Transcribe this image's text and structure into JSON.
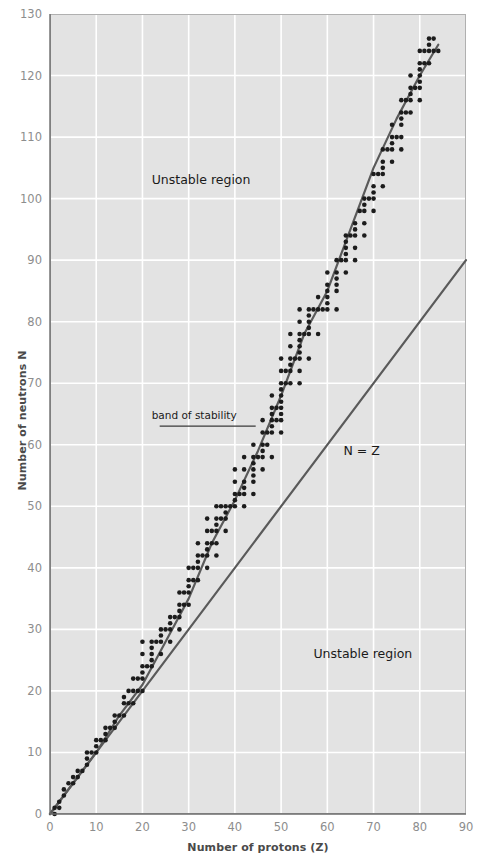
{
  "chart_data": {
    "type": "scatter",
    "title": "",
    "xlabel": "Number of protons (Z)",
    "ylabel": "Number of neutrons N",
    "xlim": [
      0,
      90
    ],
    "ylim": [
      0,
      130
    ],
    "xticks": [
      0,
      10,
      20,
      30,
      40,
      50,
      60,
      70,
      80,
      90
    ],
    "yticks": [
      0,
      10,
      20,
      30,
      40,
      50,
      60,
      70,
      80,
      90,
      100,
      110,
      120,
      130
    ],
    "grid": true,
    "legend": "none",
    "plot_background": "#e3e3e3",
    "gridline_color": "#ffffff",
    "point_color": "#1c1c1c",
    "line_color": "#5a5a5a",
    "annotations": [
      {
        "name": "unstable-region-upper",
        "text": "Unstable region",
        "x": 22,
        "y": 103
      },
      {
        "name": "unstable-region-lower",
        "text": "Unstable region",
        "x": 57,
        "y": 26
      },
      {
        "name": "n-equals-z",
        "text": "N = Z",
        "x": 63.5,
        "y": 59
      },
      {
        "name": "band-of-stability",
        "text": "band of stability",
        "x": 22,
        "y": 64.5
      }
    ],
    "series": [
      {
        "name": "N = Z line",
        "type": "line",
        "x": [
          0,
          90
        ],
        "values": [
          0,
          90
        ]
      },
      {
        "name": "band of stability curve",
        "type": "line",
        "x": [
          0,
          5,
          10,
          15,
          20,
          25,
          30,
          35,
          40,
          45,
          50,
          55,
          60,
          65,
          70,
          75,
          80,
          84
        ],
        "values": [
          0,
          5,
          10,
          16,
          21,
          28,
          35,
          44,
          51,
          59,
          68,
          78,
          85,
          95,
          105,
          113,
          120,
          125
        ]
      },
      {
        "name": "stable nuclides",
        "type": "scatter",
        "points": [
          [
            1,
            0
          ],
          [
            1,
            1
          ],
          [
            2,
            1
          ],
          [
            2,
            2
          ],
          [
            3,
            3
          ],
          [
            3,
            4
          ],
          [
            4,
            5
          ],
          [
            5,
            5
          ],
          [
            5,
            6
          ],
          [
            6,
            6
          ],
          [
            6,
            7
          ],
          [
            7,
            7
          ],
          [
            8,
            8
          ],
          [
            8,
            9
          ],
          [
            8,
            10
          ],
          [
            9,
            10
          ],
          [
            10,
            10
          ],
          [
            10,
            11
          ],
          [
            10,
            12
          ],
          [
            11,
            12
          ],
          [
            12,
            12
          ],
          [
            12,
            13
          ],
          [
            12,
            14
          ],
          [
            13,
            14
          ],
          [
            14,
            14
          ],
          [
            14,
            15
          ],
          [
            14,
            16
          ],
          [
            15,
            16
          ],
          [
            16,
            16
          ],
          [
            16,
            18
          ],
          [
            16,
            19
          ],
          [
            17,
            18
          ],
          [
            17,
            20
          ],
          [
            18,
            18
          ],
          [
            18,
            20
          ],
          [
            18,
            22
          ],
          [
            19,
            20
          ],
          [
            19,
            22
          ],
          [
            20,
            20
          ],
          [
            20,
            22
          ],
          [
            20,
            23
          ],
          [
            20,
            24
          ],
          [
            20,
            26
          ],
          [
            20,
            28
          ],
          [
            21,
            24
          ],
          [
            22,
            24
          ],
          [
            22,
            25
          ],
          [
            22,
            26
          ],
          [
            22,
            27
          ],
          [
            22,
            28
          ],
          [
            23,
            28
          ],
          [
            24,
            26
          ],
          [
            24,
            28
          ],
          [
            24,
            29
          ],
          [
            24,
            30
          ],
          [
            25,
            30
          ],
          [
            26,
            28
          ],
          [
            26,
            30
          ],
          [
            26,
            31
          ],
          [
            26,
            32
          ],
          [
            27,
            32
          ],
          [
            28,
            30
          ],
          [
            28,
            32
          ],
          [
            28,
            33
          ],
          [
            28,
            34
          ],
          [
            28,
            36
          ],
          [
            29,
            34
          ],
          [
            29,
            36
          ],
          [
            30,
            34
          ],
          [
            30,
            36
          ],
          [
            30,
            37
          ],
          [
            30,
            38
          ],
          [
            30,
            40
          ],
          [
            31,
            38
          ],
          [
            31,
            40
          ],
          [
            32,
            38
          ],
          [
            32,
            40
          ],
          [
            32,
            41
          ],
          [
            32,
            42
          ],
          [
            32,
            44
          ],
          [
            33,
            42
          ],
          [
            34,
            40
          ],
          [
            34,
            42
          ],
          [
            34,
            43
          ],
          [
            34,
            44
          ],
          [
            34,
            46
          ],
          [
            34,
            48
          ],
          [
            35,
            44
          ],
          [
            35,
            46
          ],
          [
            36,
            42
          ],
          [
            36,
            44
          ],
          [
            36,
            46
          ],
          [
            36,
            47
          ],
          [
            36,
            48
          ],
          [
            36,
            50
          ],
          [
            37,
            48
          ],
          [
            37,
            50
          ],
          [
            38,
            46
          ],
          [
            38,
            48
          ],
          [
            38,
            49
          ],
          [
            38,
            50
          ],
          [
            39,
            50
          ],
          [
            40,
            50
          ],
          [
            40,
            51
          ],
          [
            40,
            52
          ],
          [
            40,
            54
          ],
          [
            40,
            56
          ],
          [
            41,
            52
          ],
          [
            42,
            50
          ],
          [
            42,
            52
          ],
          [
            42,
            53
          ],
          [
            42,
            54
          ],
          [
            42,
            56
          ],
          [
            42,
            58
          ],
          [
            44,
            52
          ],
          [
            44,
            54
          ],
          [
            44,
            55
          ],
          [
            44,
            56
          ],
          [
            44,
            57
          ],
          [
            44,
            58
          ],
          [
            44,
            60
          ],
          [
            45,
            58
          ],
          [
            46,
            56
          ],
          [
            46,
            58
          ],
          [
            46,
            59
          ],
          [
            46,
            60
          ],
          [
            46,
            62
          ],
          [
            46,
            64
          ],
          [
            47,
            60
          ],
          [
            47,
            62
          ],
          [
            48,
            58
          ],
          [
            48,
            62
          ],
          [
            48,
            63
          ],
          [
            48,
            64
          ],
          [
            48,
            65
          ],
          [
            48,
            66
          ],
          [
            48,
            68
          ],
          [
            49,
            64
          ],
          [
            49,
            66
          ],
          [
            50,
            62
          ],
          [
            50,
            64
          ],
          [
            50,
            65
          ],
          [
            50,
            66
          ],
          [
            50,
            67
          ],
          [
            50,
            68
          ],
          [
            50,
            69
          ],
          [
            50,
            70
          ],
          [
            50,
            72
          ],
          [
            50,
            74
          ],
          [
            51,
            70
          ],
          [
            51,
            72
          ],
          [
            52,
            70
          ],
          [
            52,
            72
          ],
          [
            52,
            73
          ],
          [
            52,
            74
          ],
          [
            52,
            76
          ],
          [
            52,
            78
          ],
          [
            53,
            74
          ],
          [
            54,
            70
          ],
          [
            54,
            72
          ],
          [
            54,
            74
          ],
          [
            54,
            75
          ],
          [
            54,
            76
          ],
          [
            54,
            77
          ],
          [
            54,
            78
          ],
          [
            54,
            80
          ],
          [
            54,
            82
          ],
          [
            55,
            78
          ],
          [
            56,
            74
          ],
          [
            56,
            78
          ],
          [
            56,
            79
          ],
          [
            56,
            80
          ],
          [
            56,
            81
          ],
          [
            56,
            82
          ],
          [
            57,
            82
          ],
          [
            58,
            78
          ],
          [
            58,
            82
          ],
          [
            58,
            84
          ],
          [
            59,
            82
          ],
          [
            60,
            82
          ],
          [
            60,
            83
          ],
          [
            60,
            84
          ],
          [
            60,
            85
          ],
          [
            60,
            86
          ],
          [
            60,
            88
          ],
          [
            62,
            82
          ],
          [
            62,
            85
          ],
          [
            62,
            86
          ],
          [
            62,
            87
          ],
          [
            62,
            88
          ],
          [
            62,
            90
          ],
          [
            63,
            90
          ],
          [
            64,
            88
          ],
          [
            64,
            90
          ],
          [
            64,
            91
          ],
          [
            64,
            92
          ],
          [
            64,
            93
          ],
          [
            64,
            94
          ],
          [
            65,
            94
          ],
          [
            66,
            90
          ],
          [
            66,
            92
          ],
          [
            66,
            94
          ],
          [
            66,
            95
          ],
          [
            66,
            96
          ],
          [
            67,
            98
          ],
          [
            68,
            94
          ],
          [
            68,
            96
          ],
          [
            68,
            98
          ],
          [
            68,
            99
          ],
          [
            68,
            100
          ],
          [
            69,
            100
          ],
          [
            70,
            98
          ],
          [
            70,
            100
          ],
          [
            70,
            101
          ],
          [
            70,
            102
          ],
          [
            70,
            104
          ],
          [
            71,
            104
          ],
          [
            72,
            102
          ],
          [
            72,
            104
          ],
          [
            72,
            105
          ],
          [
            72,
            106
          ],
          [
            72,
            108
          ],
          [
            73,
            108
          ],
          [
            74,
            106
          ],
          [
            74,
            108
          ],
          [
            74,
            109
          ],
          [
            74,
            110
          ],
          [
            74,
            112
          ],
          [
            75,
            110
          ],
          [
            76,
            108
          ],
          [
            76,
            110
          ],
          [
            76,
            112
          ],
          [
            76,
            113
          ],
          [
            76,
            114
          ],
          [
            76,
            116
          ],
          [
            77,
            114
          ],
          [
            77,
            116
          ],
          [
            78,
            114
          ],
          [
            78,
            116
          ],
          [
            78,
            117
          ],
          [
            78,
            118
          ],
          [
            78,
            120
          ],
          [
            79,
            118
          ],
          [
            80,
            116
          ],
          [
            80,
            118
          ],
          [
            80,
            119
          ],
          [
            80,
            120
          ],
          [
            80,
            121
          ],
          [
            80,
            122
          ],
          [
            80,
            124
          ],
          [
            81,
            122
          ],
          [
            81,
            124
          ],
          [
            82,
            122
          ],
          [
            82,
            124
          ],
          [
            82,
            125
          ],
          [
            82,
            126
          ],
          [
            83,
            126
          ],
          [
            84,
            124
          ],
          [
            83,
            124
          ]
        ]
      }
    ]
  }
}
